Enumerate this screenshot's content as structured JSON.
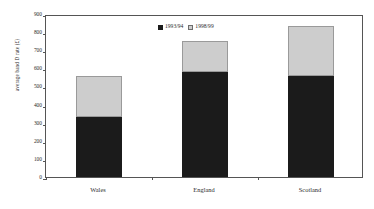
{
  "chart_data": {
    "type": "bar",
    "stacked": true,
    "title": "",
    "subtitle": "",
    "xlabel": "",
    "ylabel": "average band D rate (£)",
    "categories": [
      "Wales",
      "England",
      "Scotland"
    ],
    "series": [
      {
        "name": "1993/94",
        "values": [
          330,
          580,
          560
        ],
        "color": "#1b1b1b"
      },
      {
        "name": "1998/99",
        "values": [
          230,
          170,
          275
        ],
        "color": "#cdcdcd"
      }
    ],
    "totals": [
      560,
      750,
      835
    ],
    "ylim": [
      0,
      900
    ],
    "ytick_step": 100,
    "yticks": [
      0,
      100,
      200,
      300,
      400,
      500,
      600,
      700,
      800,
      900
    ],
    "ytick_labels": [
      "0",
      "100",
      "200",
      "300",
      "400",
      "500",
      "600",
      "700",
      "800",
      "900"
    ],
    "grid": false,
    "legend_position": "top-center",
    "frame": true
  },
  "legend": {
    "entries": [
      {
        "label": "1993/94",
        "swatch": "dark"
      },
      {
        "label": "1998/99",
        "swatch": "light"
      }
    ]
  },
  "colors": {
    "series_1993_94": "#1b1b1b",
    "series_1998_99": "#cdcdcd",
    "axis": "#555555",
    "text": "#2b2b2b",
    "background": "#ffffff"
  }
}
